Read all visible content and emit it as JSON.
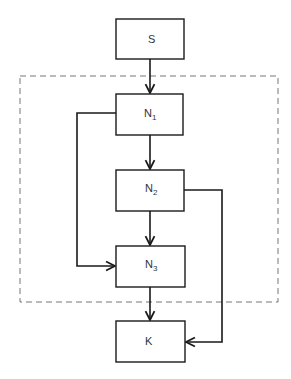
{
  "diagram": {
    "type": "flowchart",
    "colors": {
      "stroke": "#1a1a1a",
      "dashed_boundary": "#777777",
      "text": "#333333"
    },
    "boundary": {
      "style": "dashed",
      "encloses": [
        "N1",
        "N2",
        "N3"
      ]
    },
    "nodes": [
      {
        "id": "S",
        "label": "S",
        "sub": ""
      },
      {
        "id": "N1",
        "label": "N",
        "sub": "1"
      },
      {
        "id": "N2",
        "label": "N",
        "sub": "2"
      },
      {
        "id": "N3",
        "label": "N",
        "sub": "3"
      },
      {
        "id": "K",
        "label": "K",
        "sub": ""
      }
    ],
    "edges": [
      {
        "from": "S",
        "to": "N1"
      },
      {
        "from": "N1",
        "to": "N2"
      },
      {
        "from": "N1",
        "to": "N3",
        "route": "left-loop"
      },
      {
        "from": "N2",
        "to": "N3"
      },
      {
        "from": "N2",
        "to": "K",
        "route": "right-loop"
      },
      {
        "from": "N3",
        "to": "K"
      }
    ]
  }
}
